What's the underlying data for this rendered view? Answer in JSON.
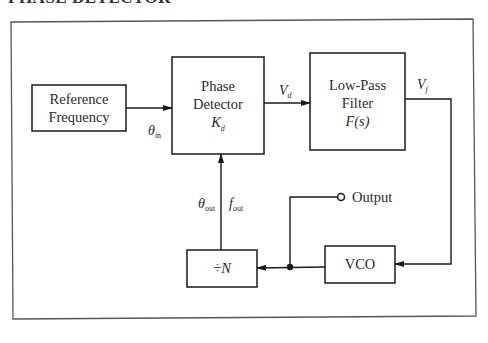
{
  "page": {
    "heading_partial": "PHASE DETECTOR",
    "heading_note": "heading clipped at top edge"
  },
  "diagram": {
    "blocks": {
      "reference": {
        "line1": "Reference",
        "line2": "Frequency"
      },
      "phase_detector": {
        "line1": "Phase",
        "line2": "Detector",
        "gain": "K",
        "gain_sub": "d"
      },
      "low_pass_filter": {
        "line1": "Low-Pass",
        "line2": "Filter",
        "transfer": "F(s)"
      },
      "vco": {
        "label": "VCO"
      },
      "divider": {
        "label": "÷N"
      }
    },
    "signals": {
      "theta_in": {
        "sym": "θ",
        "sub": "in"
      },
      "v_d": {
        "sym": "V",
        "sub": "d"
      },
      "v_f": {
        "sym": "V",
        "sub": "f"
      },
      "theta_out": {
        "sym": "θ",
        "sub": "out"
      },
      "f_out": {
        "sym": "f",
        "sub": "out"
      },
      "output": "Output"
    },
    "connections": [
      {
        "from": "Reference Frequency",
        "to": "Phase Detector",
        "label": "θin"
      },
      {
        "from": "Phase Detector",
        "to": "Low-Pass Filter",
        "label": "Vd"
      },
      {
        "from": "Low-Pass Filter",
        "to": "VCO",
        "label": "Vf"
      },
      {
        "from": "VCO",
        "to": "÷N"
      },
      {
        "from": "VCO",
        "to": "Output"
      },
      {
        "from": "÷N",
        "to": "Phase Detector",
        "label": "θout fout"
      }
    ]
  }
}
